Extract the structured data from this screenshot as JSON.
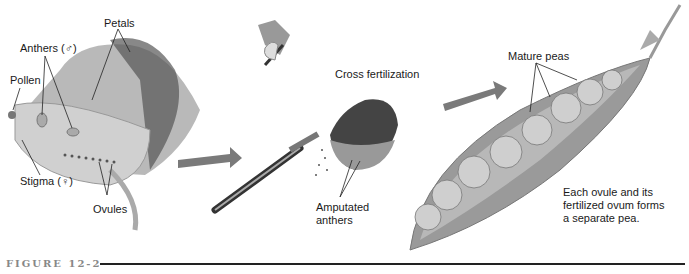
{
  "figure": {
    "label": "FIGURE 12-2",
    "panels": [
      {
        "id": "flower",
        "labels": {
          "petals": "Petals",
          "anthers": "Anthers (♂)",
          "pollen": "Pollen",
          "stigma": "Stigma (♀)",
          "ovules": "Ovules"
        }
      },
      {
        "id": "cross-fertilization",
        "labels": {
          "cross_fertilization": "Cross fertilization",
          "amputated_anthers_line1": "Amputated",
          "amputated_anthers_line2": "anthers"
        }
      },
      {
        "id": "pea-pod",
        "labels": {
          "mature_peas": "Mature peas",
          "caption_line1": "Each ovule and its",
          "caption_line2": "fertilized ovum forms",
          "caption_line3": "a separate pea."
        }
      }
    ]
  },
  "colors": {
    "petal": "#8a8a8a",
    "petal_dark": "#4a4a4a",
    "arrow": "#7a7a7a",
    "pod": "#9a9a9a",
    "pea": "#c8c8c8",
    "rule": "#222222"
  }
}
